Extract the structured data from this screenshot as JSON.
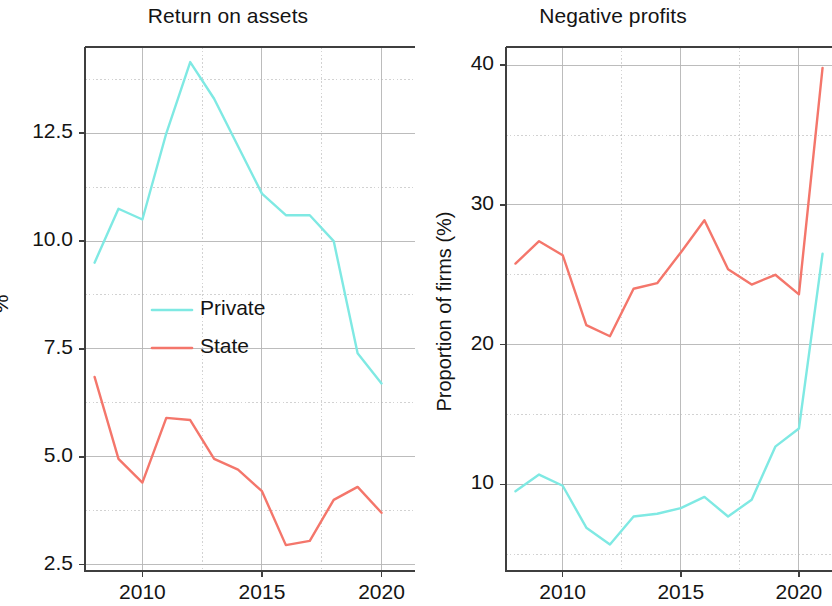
{
  "figure": {
    "background": "#ffffff",
    "panels": [
      {
        "id": "return-on-assets",
        "title": "Return on assets",
        "ylabel": "%"
      },
      {
        "id": "negative-profits",
        "title": "Negative profits",
        "ylabel": "Proportion of firms (%)"
      }
    ]
  },
  "colors": {
    "private": "#7fe9e3",
    "state": "#f4766b",
    "axis": "#3f3f3f",
    "grid": "#b5b5b5",
    "text": "#141414"
  },
  "legend": {
    "position": "center-left-inside",
    "entries": [
      {
        "label": "Private",
        "color": "#7fe9e3"
      },
      {
        "label": "State",
        "color": "#f4766b"
      }
    ]
  },
  "chart_data": [
    {
      "type": "line",
      "title": "Return on assets",
      "xlabel": "",
      "ylabel": "%",
      "xlim": [
        2007.6,
        2021.4
      ],
      "ylim": [
        2.35,
        14.5
      ],
      "xticks": [
        2010,
        2015,
        2020
      ],
      "xticklabels": [
        "2010",
        "2015",
        "2020"
      ],
      "yticks": [
        2.5,
        5.0,
        7.5,
        10.0,
        12.5
      ],
      "yticklabels": [
        "2.5",
        "5.0",
        "7.5",
        "10.0",
        "12.5"
      ],
      "minor_yticks": [
        3.75,
        6.25,
        8.75,
        11.25,
        13.75
      ],
      "minor_xticks": [
        2012.5,
        2017.5
      ],
      "grid": true,
      "legend": [
        "Private",
        "State"
      ],
      "x": [
        2008,
        2009,
        2010,
        2011,
        2012,
        2013,
        2014,
        2015,
        2016,
        2017,
        2018,
        2019,
        2020
      ],
      "series": [
        {
          "name": "Private",
          "color": "#7fe9e3",
          "values": [
            9.5,
            10.75,
            10.5,
            12.5,
            14.15,
            13.3,
            12.2,
            11.1,
            10.6,
            10.6,
            10.0,
            7.4,
            6.7
          ]
        },
        {
          "name": "State",
          "color": "#f4766b",
          "values": [
            6.85,
            4.95,
            4.4,
            5.9,
            5.85,
            4.95,
            4.7,
            4.2,
            2.95,
            3.05,
            4.0,
            4.3,
            3.7
          ]
        }
      ]
    },
    {
      "type": "line",
      "title": "Negative profits",
      "xlabel": "",
      "ylabel": "Proportion of firms (%)",
      "xlim": [
        2007.6,
        2021.4
      ],
      "ylim": [
        3.8,
        41.3
      ],
      "xticks": [
        2010,
        2015,
        2020
      ],
      "xticklabels": [
        "2010",
        "2015",
        "2020"
      ],
      "yticks": [
        10,
        20,
        30,
        40
      ],
      "yticklabels": [
        "10",
        "20",
        "30",
        "40"
      ],
      "minor_yticks": [
        5,
        15,
        25,
        35
      ],
      "minor_xticks": [
        2012.5,
        2017.5
      ],
      "grid": true,
      "legend": [
        "Private",
        "State"
      ],
      "x": [
        2008,
        2009,
        2010,
        2011,
        2012,
        2013,
        2014,
        2015,
        2016,
        2017,
        2018,
        2019,
        2020,
        2021
      ],
      "series": [
        {
          "name": "Private",
          "color": "#7fe9e3",
          "values": [
            9.5,
            10.7,
            9.9,
            6.9,
            5.7,
            7.7,
            7.9,
            8.3,
            9.1,
            7.7,
            8.9,
            12.7,
            14.0,
            26.5
          ]
        },
        {
          "name": "State",
          "color": "#f4766b",
          "values": [
            25.8,
            27.4,
            26.4,
            21.4,
            20.6,
            24.0,
            24.4,
            26.6,
            28.9,
            25.4,
            24.3,
            25.0,
            23.6,
            39.8
          ]
        }
      ]
    }
  ]
}
